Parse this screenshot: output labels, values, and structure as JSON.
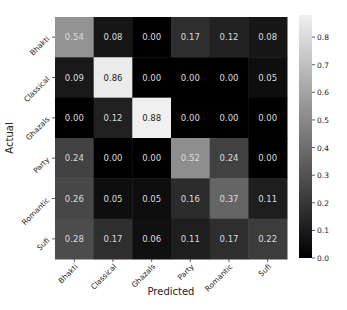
{
  "chart_data": {
    "type": "heatmap",
    "title": "",
    "xlabel": "Predicted",
    "ylabel": "Actual",
    "x_categories": [
      "Bhakti",
      "Classical",
      "Ghazals",
      "Party",
      "Romantic",
      "Sufi"
    ],
    "y_categories": [
      "Bhakti",
      "Classical",
      "Ghazals",
      "Party",
      "Romantic",
      "Sufi"
    ],
    "values": [
      [
        0.54,
        0.08,
        0.0,
        0.17,
        0.12,
        0.08
      ],
      [
        0.09,
        0.86,
        0.0,
        0.0,
        0.0,
        0.05
      ],
      [
        0.0,
        0.12,
        0.88,
        0.0,
        0.0,
        0.0
      ],
      [
        0.24,
        0.0,
        0.0,
        0.52,
        0.24,
        0.0
      ],
      [
        0.26,
        0.05,
        0.05,
        0.16,
        0.37,
        0.11
      ],
      [
        0.28,
        0.17,
        0.06,
        0.11,
        0.17,
        0.22
      ]
    ],
    "colormap": "gray",
    "colorbar": {
      "vmin": 0.0,
      "vmax": 0.88,
      "ticks": [
        0.0,
        0.1,
        0.2,
        0.3,
        0.4,
        0.5,
        0.6,
        0.7,
        0.8
      ],
      "tick_labels": [
        "0.0",
        "0.1",
        "0.2",
        "0.3",
        "0.4",
        "0.5",
        "0.6",
        "0.7",
        "0.8"
      ]
    },
    "grid": false,
    "legend_position": "colorbar-right"
  }
}
